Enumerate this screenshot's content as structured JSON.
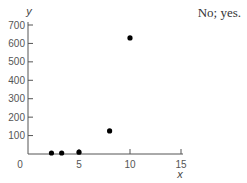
{
  "answer_text": "No; yes.",
  "chart_data": {
    "type": "scatter",
    "title": "",
    "xlabel": "x",
    "ylabel": "y",
    "xlim": [
      0,
      15
    ],
    "ylim": [
      0,
      700
    ],
    "xticks": [
      0,
      5,
      10,
      15
    ],
    "yticks": [
      100,
      200,
      300,
      400,
      500,
      600,
      700
    ],
    "grid": false,
    "legend": null,
    "points": [
      {
        "x": 2.3,
        "y": 0
      },
      {
        "x": 3.3,
        "y": 3
      },
      {
        "x": 5,
        "y": 10
      },
      {
        "x": 8,
        "y": 125
      },
      {
        "x": 10,
        "y": 630
      }
    ],
    "marker_color": "#000000",
    "axis_color": "#555555"
  }
}
